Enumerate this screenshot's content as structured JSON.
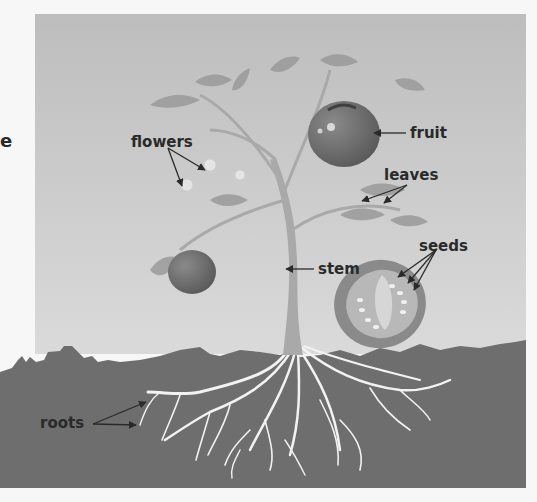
{
  "diagram": {
    "colors": {
      "page_background": "#f7f7f7",
      "sky_panel": "#c8c8c8",
      "soil": "#6e6e6e",
      "roots": "#f2f2f2",
      "stem": "#a9a9a9",
      "leaves": "#9a9a9a",
      "fruit": "#6a6a6a",
      "label_text": "#2a2a2a"
    },
    "cut_off_text": "e",
    "labels": [
      {
        "id": "flowers",
        "text": "flowers",
        "x": 131,
        "y": 133
      },
      {
        "id": "fruit",
        "text": "fruit",
        "x": 410,
        "y": 124
      },
      {
        "id": "leaves",
        "text": "leaves",
        "x": 384,
        "y": 166
      },
      {
        "id": "seeds",
        "text": "seeds",
        "x": 419,
        "y": 237
      },
      {
        "id": "stem",
        "text": "stem",
        "x": 318,
        "y": 260
      },
      {
        "id": "roots",
        "text": "roots",
        "x": 40,
        "y": 414
      }
    ]
  }
}
